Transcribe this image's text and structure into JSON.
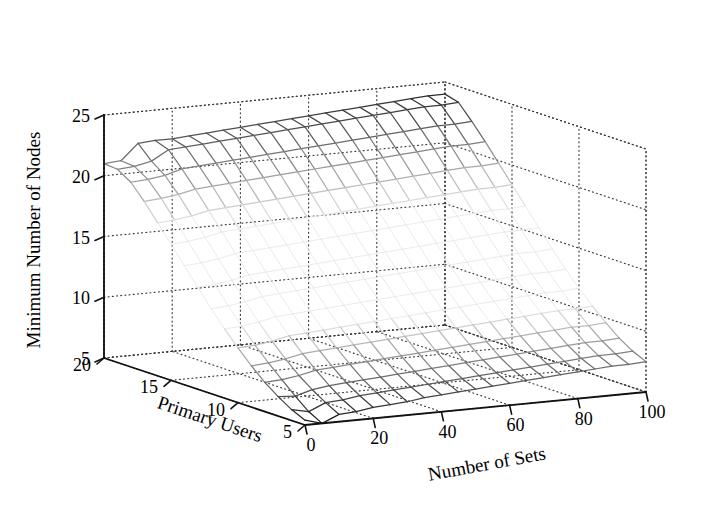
{
  "figure": {
    "width": 724,
    "height": 520,
    "background": "#ffffff",
    "plot_type": "3d-mesh-surface",
    "line_color_dark": "#1a1a1a",
    "line_color_mid": "#8c8c8c",
    "line_color_light": "#e2e2e2",
    "box_color": "#333333",
    "grid_style": "dotted"
  },
  "axes": {
    "z": {
      "label": "Minimum Number of Nodes",
      "ticks": [
        "25",
        "20",
        "15",
        "10",
        "5"
      ],
      "tick_values": [
        25,
        20,
        15,
        10,
        5
      ],
      "min": 5,
      "max": 25
    },
    "y": {
      "label": "Primary Users",
      "ticks": [
        "20",
        "15",
        "10",
        "5"
      ],
      "tick_values": [
        20,
        15,
        10,
        5
      ],
      "min": 5,
      "max": 20
    },
    "x": {
      "label": "Number of Sets",
      "ticks": [
        "0",
        "20",
        "40",
        "60",
        "80",
        "100"
      ],
      "tick_values": [
        0,
        20,
        40,
        60,
        80,
        100
      ],
      "min": 0,
      "max": 100
    }
  },
  "chart_data": {
    "type": "surface",
    "title": "",
    "xlabel": "Number of Sets",
    "ylabel": "Primary Users",
    "zlabel": "Minimum Number of Nodes",
    "xlim": [
      0,
      100
    ],
    "ylim": [
      5,
      20
    ],
    "zlim": [
      5,
      25
    ],
    "grid": true,
    "legend": "none",
    "x": [
      0,
      5,
      10,
      15,
      20,
      25,
      30,
      35,
      40,
      45,
      50,
      55,
      60,
      65,
      70,
      75,
      80,
      85,
      90,
      95,
      100
    ],
    "y": [
      20,
      19,
      18,
      17,
      16,
      15,
      14,
      13,
      12,
      11,
      10,
      9,
      8,
      7,
      6,
      5
    ],
    "z": [
      [
        21.0,
        21.1,
        22.4,
        22.5,
        22.5,
        22.6,
        22.7,
        22.8,
        22.9,
        23.0,
        23.1,
        23.2,
        23.3,
        23.4,
        23.5,
        23.6,
        23.7,
        23.8,
        23.9,
        24.0,
        24.0
      ],
      [
        20.9,
        21.0,
        21.3,
        22.1,
        22.2,
        22.3,
        22.4,
        22.5,
        22.6,
        22.7,
        22.8,
        22.9,
        23.0,
        23.1,
        23.2,
        23.3,
        23.4,
        23.5,
        23.6,
        23.6,
        23.7
      ],
      [
        20.2,
        20.3,
        20.5,
        20.9,
        21.0,
        21.1,
        21.2,
        21.3,
        21.4,
        21.5,
        21.6,
        21.7,
        21.8,
        21.9,
        22.0,
        22.1,
        22.2,
        22.3,
        22.4,
        22.4,
        22.5
      ],
      [
        19.0,
        19.1,
        19.3,
        19.6,
        19.7,
        19.8,
        19.9,
        20.0,
        20.1,
        20.2,
        20.3,
        20.4,
        20.5,
        20.6,
        20.7,
        20.8,
        20.9,
        21.0,
        21.1,
        21.1,
        21.2
      ],
      [
        17.6,
        17.7,
        17.9,
        18.2,
        18.3,
        18.4,
        18.5,
        18.6,
        18.7,
        18.8,
        18.9,
        19.0,
        19.1,
        19.2,
        19.3,
        19.4,
        19.5,
        19.6,
        19.7,
        19.7,
        19.8
      ],
      [
        16.2,
        16.3,
        16.5,
        16.8,
        16.9,
        17.0,
        17.1,
        17.2,
        17.3,
        17.4,
        17.5,
        17.6,
        17.7,
        17.8,
        17.9,
        18.0,
        18.1,
        18.2,
        18.3,
        18.3,
        18.4
      ],
      [
        14.8,
        14.9,
        15.1,
        15.4,
        15.5,
        15.6,
        15.7,
        15.8,
        15.9,
        16.0,
        16.1,
        16.2,
        16.3,
        16.4,
        16.5,
        16.6,
        16.7,
        16.8,
        16.9,
        16.9,
        17.0
      ],
      [
        13.4,
        13.5,
        13.7,
        14.0,
        14.1,
        14.2,
        14.3,
        14.4,
        14.5,
        14.6,
        14.7,
        14.8,
        14.9,
        15.0,
        15.1,
        15.2,
        15.3,
        15.4,
        15.5,
        15.5,
        15.6
      ],
      [
        12.0,
        12.1,
        12.3,
        12.6,
        12.7,
        12.8,
        12.9,
        13.0,
        13.1,
        13.2,
        13.3,
        13.4,
        13.5,
        13.6,
        13.7,
        13.8,
        13.9,
        14.0,
        14.1,
        14.1,
        14.2
      ],
      [
        10.7,
        10.8,
        11.0,
        11.3,
        11.4,
        11.5,
        11.6,
        11.7,
        11.8,
        11.9,
        12.0,
        12.1,
        12.2,
        12.3,
        12.4,
        12.5,
        12.6,
        12.7,
        12.8,
        12.8,
        12.9
      ],
      [
        9.5,
        9.6,
        9.8,
        10.1,
        10.2,
        10.3,
        10.4,
        10.5,
        10.6,
        10.7,
        10.8,
        10.9,
        11.0,
        11.1,
        11.2,
        11.3,
        11.4,
        11.5,
        11.6,
        11.6,
        11.7
      ],
      [
        8.4,
        8.5,
        8.7,
        9.0,
        9.1,
        9.2,
        9.3,
        9.4,
        9.5,
        9.6,
        9.7,
        9.8,
        9.9,
        10.0,
        10.1,
        10.2,
        10.3,
        10.4,
        10.5,
        10.5,
        10.6
      ],
      [
        7.4,
        7.5,
        7.7,
        8.0,
        8.1,
        8.2,
        8.3,
        8.4,
        8.5,
        8.6,
        8.7,
        8.8,
        8.9,
        9.0,
        9.1,
        9.2,
        9.3,
        9.4,
        9.5,
        9.5,
        9.6
      ],
      [
        6.6,
        6.5,
        6.9,
        7.1,
        7.2,
        7.3,
        7.4,
        7.5,
        7.6,
        7.7,
        7.8,
        7.9,
        8.0,
        8.1,
        8.2,
        8.3,
        8.4,
        8.5,
        8.6,
        8.6,
        8.7
      ],
      [
        5.9,
        5.6,
        6.2,
        6.3,
        6.5,
        6.6,
        6.7,
        6.8,
        6.9,
        7.0,
        7.1,
        7.2,
        7.3,
        7.4,
        7.5,
        7.6,
        7.7,
        7.8,
        7.9,
        7.9,
        8.0
      ],
      [
        5.4,
        5.0,
        5.6,
        5.7,
        5.9,
        6.0,
        6.1,
        6.3,
        6.4,
        6.5,
        6.6,
        6.7,
        6.8,
        6.9,
        7.0,
        7.1,
        7.2,
        7.3,
        7.4,
        7.4,
        7.5
      ]
    ]
  }
}
